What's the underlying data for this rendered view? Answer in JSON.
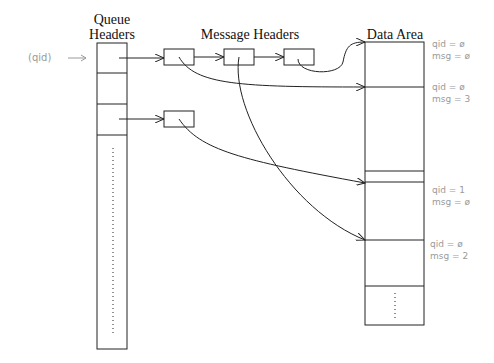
{
  "diagram": {
    "columns": {
      "queue_headers": {
        "line1": "Queue",
        "line2": "Headers"
      },
      "message_headers": "Message Headers",
      "data_area": "Data Area"
    },
    "qid_pointer_label": "(qid) →",
    "annotations": [
      {
        "qid": "qid = ø",
        "msg": "msg = ø"
      },
      {
        "qid": "qid = ø",
        "msg": "msg = 3"
      },
      {
        "qid": "qid = 1",
        "msg": "msg = ø"
      },
      {
        "qid": "qid = ø",
        "msg": "msg = 2"
      }
    ],
    "colors": {
      "line": "#222222",
      "annotation": "#9a9a9a"
    }
  }
}
